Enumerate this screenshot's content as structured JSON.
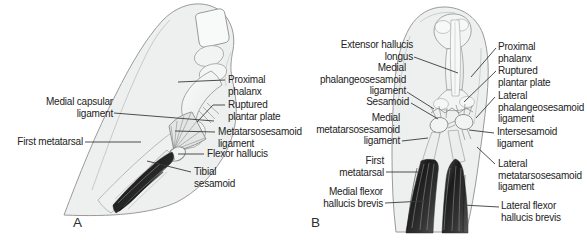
{
  "figure": {
    "panel_a": {
      "letter": "A",
      "labels": {
        "medial_capsular_ligament": {
          "line1": "Medial capsular",
          "line2": "ligament"
        },
        "first_metatarsal": {
          "line1": "First metatarsal"
        },
        "proximal_phalanx": {
          "line1": "Proximal",
          "line2": "phalanx"
        },
        "ruptured_plantar_plate": {
          "line1": "Ruptured",
          "line2": "plantar plate"
        },
        "metatarsosesamoid_ligament": {
          "line1": "Metatarsosesamoid",
          "line2": "ligament"
        },
        "flexor_hallucis": {
          "line1": "Flexor hallucis"
        },
        "tibial_sesamoid": {
          "line1": "Tibial",
          "line2": "sesamoid"
        }
      }
    },
    "panel_b": {
      "letter": "B",
      "labels": {
        "extensor_hallucis_longus": {
          "line1": "Extensor hallucis",
          "line2": "longus"
        },
        "medial_phalangeosesamoid_ligament": {
          "line1": "Medial",
          "line2": "phalangeosesamoid",
          "line3": "ligament"
        },
        "sesamoid": {
          "line1": "Sesamoid"
        },
        "medial_metatarsosesamoid_ligament": {
          "line1": "Medial",
          "line2": "metatarsosesamoid",
          "line3": "ligament"
        },
        "first_metatarsal": {
          "line1": "First",
          "line2": "metatarsal"
        },
        "medial_flexor_hallucis_brevis": {
          "line1": "Medial flexor",
          "line2": "hallucis brevis"
        },
        "proximal_phalanx": {
          "line1": "Proximal",
          "line2": "phalanx"
        },
        "ruptured_plantar_plate": {
          "line1": "Ruptured",
          "line2": "plantar plate"
        },
        "lateral_phalangeosesamoid_ligament": {
          "line1": "Lateral",
          "line2": "phalangeosesamoid",
          "line3": "ligament"
        },
        "intersesamoid_ligament": {
          "line1": "Intersesamoid",
          "line2": "ligament"
        },
        "lateral_metatarsosesamoid_ligament": {
          "line1": "Lateral",
          "line2": "metatarsosesamoid",
          "line3": "ligament"
        },
        "lateral_flexor_hallucis_brevis": {
          "line1": "Lateral flexor",
          "line2": "hallucis brevis"
        }
      }
    },
    "colors": {
      "background": "#ffffff",
      "label_text": "#232323",
      "leader_line": "#3a3a3a",
      "skin_fill": "#eef0f0",
      "bone_fill": "#f3f4f4",
      "ligament_fill": "#e4e6e6",
      "muscle_dark": "#262626",
      "outline_stroke": "#9a9a9a"
    }
  }
}
